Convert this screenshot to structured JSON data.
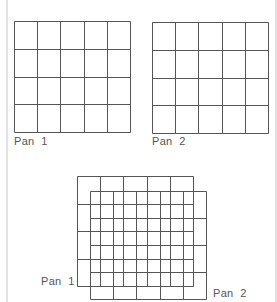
{
  "figure": {
    "panels": [
      {
        "id": "pan1",
        "label": "Pan  1",
        "columns": 5,
        "rows": 4
      },
      {
        "id": "pan2",
        "label": "Pan  2",
        "columns": 5,
        "rows": 4
      }
    ],
    "overlay": {
      "description": "Pan 1 and Pan 2 overlapped with an offset",
      "label_back": "Pan  1",
      "label_front": "Pan  2"
    }
  },
  "colors": {
    "grid_line": "#555555",
    "label": "#555555",
    "border": "#e2e2e2"
  }
}
